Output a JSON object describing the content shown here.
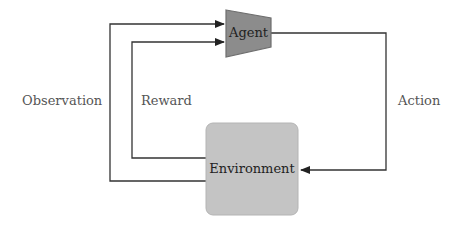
{
  "diagram": {
    "type": "reinforcement-learning-loop",
    "nodes": {
      "agent": {
        "label": "Agent",
        "shape": "trapezoid",
        "fill": "#8c8c8c",
        "stroke": "#6e6e6e"
      },
      "environment": {
        "label": "Environment",
        "shape": "rounded-rectangle",
        "fill": "#c4c4c4",
        "stroke": "#b0b0b0"
      }
    },
    "edges": [
      {
        "from": "agent",
        "to": "environment",
        "label": "Action"
      },
      {
        "from": "environment",
        "to": "agent",
        "label": "Observation"
      },
      {
        "from": "environment",
        "to": "agent",
        "label": "Reward"
      }
    ],
    "colors": {
      "line": "#333333",
      "label_text": "#555555"
    }
  }
}
